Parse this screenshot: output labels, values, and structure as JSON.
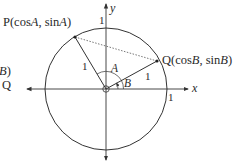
{
  "diagram": {
    "type": "unit-circle",
    "labels": {
      "P": "P(cos",
      "P_A": "A",
      "P_mid": ", sin",
      "P_A2": "A",
      "P_close": ")",
      "Q": "Q(cos",
      "Q_B": "B",
      "Q_mid": ", sin",
      "Q_B2": "B",
      "Q_close": ")",
      "x_axis": "x",
      "y_axis": "y",
      "angle_A": "A",
      "angle_B": "B",
      "radius_OP": "1",
      "radius_OQ": "1",
      "tick_x": "1",
      "tick_y": "1",
      "clipped_top": "B)",
      "clipped_bottom": "Q"
    },
    "colors": {
      "stroke": "#333333",
      "dotted": "#555555",
      "text": "#2a2a2a"
    }
  }
}
